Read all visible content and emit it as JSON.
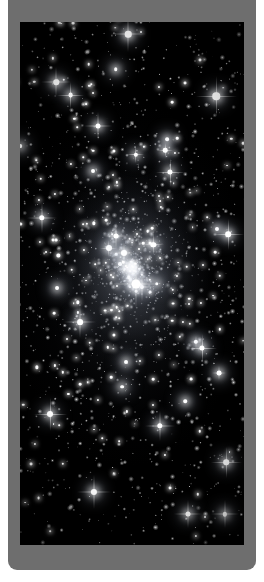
{
  "figure": {
    "caption": "It could be infinite!",
    "caption_color": "#ffffff",
    "panel_color": "#6e6e6e",
    "page_background": "#ffffff"
  },
  "image": {
    "alt_name": "globular-star-cluster",
    "description": "Dense field of white stars on a black sky, brightening toward a concentrated cluster core near the center",
    "background_color": "#000000",
    "star_color": "#ffffff",
    "core_position": {
      "x_pct": 50,
      "y_pct": 47
    }
  }
}
